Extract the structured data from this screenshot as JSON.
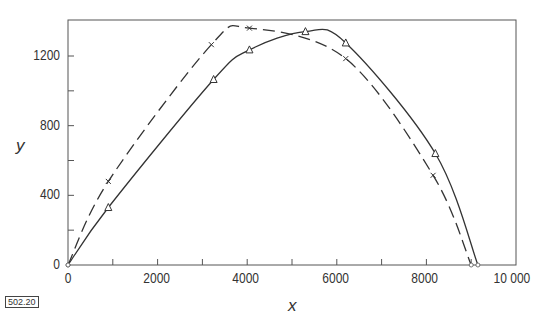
{
  "chart_data": {
    "type": "line",
    "title": "",
    "xlabel": "x",
    "ylabel": "y",
    "xlim": [
      0,
      10000
    ],
    "ylim": [
      0,
      1400
    ],
    "x_ticks": [
      "0",
      "2000",
      "4000",
      "6000",
      "8000",
      "10000"
    ],
    "x_tick_display": [
      "0",
      "2000",
      "4000",
      "6000",
      "8000",
      "10 000"
    ],
    "y_ticks": [
      "0",
      "400",
      "800",
      "1200"
    ],
    "grid": false,
    "legend": "none",
    "series": [
      {
        "name": "dashed (x markers)",
        "line_style": "dashed",
        "marker": "x",
        "x": [
          0,
          900,
          3200,
          4050,
          6200,
          8150,
          9000
        ],
        "y": [
          0,
          480,
          1265,
          1360,
          1185,
          515,
          0
        ]
      },
      {
        "name": "solid (triangle markers)",
        "line_style": "solid",
        "marker": "triangle",
        "x": [
          0,
          900,
          3250,
          4050,
          5300,
          6200,
          8200,
          9150
        ],
        "y": [
          0,
          330,
          1065,
          1235,
          1340,
          1275,
          640,
          0
        ]
      }
    ]
  },
  "figure_id": "502.20"
}
